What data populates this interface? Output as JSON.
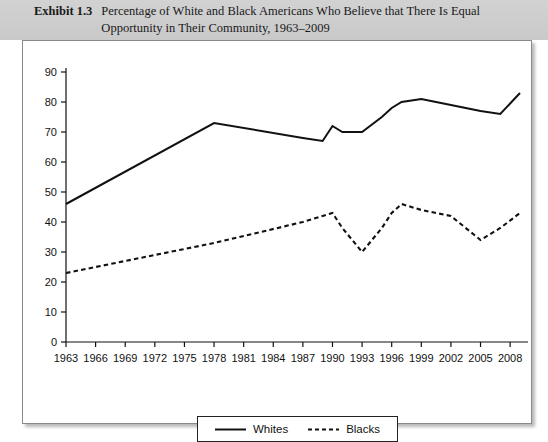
{
  "exhibit": {
    "label": "Exhibit 1.3",
    "title": "Percentage of White and Black Americans Who Believe that There Is Equal Opportunity in Their Community, 1963–2009"
  },
  "chart_data": {
    "type": "line",
    "title": "Percentage of White and Black Americans Who Believe that There Is Equal Opportunity in Their Community, 1963–2009",
    "xlabel": "",
    "ylabel": "",
    "xlim": [
      1963,
      2009
    ],
    "ylim": [
      0,
      90
    ],
    "ytick_step": 10,
    "grid": false,
    "legend_position": "bottom",
    "yticks": [
      0,
      10,
      20,
      30,
      40,
      50,
      60,
      70,
      80,
      90
    ],
    "xticks": [
      1963,
      1966,
      1969,
      1972,
      1975,
      1978,
      1981,
      1984,
      1987,
      1990,
      1993,
      1996,
      1999,
      2002,
      2005,
      2008
    ],
    "x": [
      1963,
      1978,
      1987,
      1989,
      1990,
      1991,
      1993,
      1995,
      1996,
      1997,
      1999,
      2002,
      2005,
      2007,
      2009
    ],
    "series": [
      {
        "name": "Whites",
        "style": "solid",
        "color": "#111111",
        "values": [
          46,
          73,
          68,
          67,
          72,
          70,
          70,
          75,
          78,
          80,
          81,
          79,
          77,
          76,
          83
        ]
      },
      {
        "name": "Blacks",
        "style": "dashed",
        "color": "#111111",
        "values": [
          23,
          33,
          40,
          42,
          43,
          38,
          30,
          38,
          43,
          46,
          44,
          42,
          34,
          38,
          43
        ]
      }
    ]
  },
  "legend": {
    "items": [
      {
        "label": "Whites",
        "style": "solid"
      },
      {
        "label": "Blacks",
        "style": "dashed"
      }
    ]
  },
  "axis_colors": {
    "axis": "#111111",
    "series": "#111111",
    "header_band": "#cfcfcf"
  }
}
